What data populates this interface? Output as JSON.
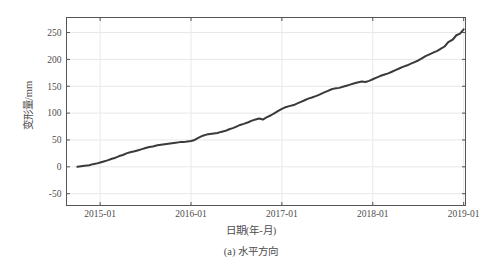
{
  "figure": {
    "caption": "(a) 水平方向"
  },
  "chart_data": {
    "type": "line",
    "title": "",
    "subtitle": "",
    "xlabel": "日期(年-月)",
    "ylabel": "变形量/mm",
    "xtick_labels": [
      "2015-01",
      "2016-01",
      "2017-01",
      "2018-01",
      "2019-01"
    ],
    "xtick_values": [
      2015.0,
      2016.0,
      2017.0,
      2018.0,
      2019.0
    ],
    "ytick_labels": [
      "-50",
      "0",
      "50",
      "100",
      "150",
      "200",
      "250"
    ],
    "ytick_values": [
      -50,
      0,
      50,
      100,
      150,
      200,
      250
    ],
    "xlim": [
      2014.63,
      2019.02
    ],
    "ylim": [
      -72,
      278
    ],
    "grid": true,
    "legend": null,
    "line_color": "#3a3a3a",
    "line_width": 2.0,
    "grid_color": "#e8e8e8",
    "axis_color": "#555555",
    "series": [
      {
        "name": "水平方向变形量",
        "x": [
          2014.75,
          2014.79,
          2014.83,
          2014.88,
          2014.92,
          2014.96,
          2015.0,
          2015.04,
          2015.08,
          2015.13,
          2015.17,
          2015.21,
          2015.25,
          2015.29,
          2015.33,
          2015.38,
          2015.42,
          2015.46,
          2015.5,
          2015.54,
          2015.58,
          2015.63,
          2015.67,
          2015.71,
          2015.75,
          2015.79,
          2015.83,
          2015.88,
          2015.92,
          2015.96,
          2016.0,
          2016.04,
          2016.08,
          2016.13,
          2016.17,
          2016.21,
          2016.25,
          2016.29,
          2016.33,
          2016.38,
          2016.42,
          2016.46,
          2016.5,
          2016.54,
          2016.58,
          2016.63,
          2016.67,
          2016.71,
          2016.75,
          2016.79,
          2016.83,
          2016.88,
          2016.92,
          2016.96,
          2017.0,
          2017.04,
          2017.08,
          2017.13,
          2017.17,
          2017.21,
          2017.25,
          2017.29,
          2017.33,
          2017.38,
          2017.42,
          2017.46,
          2017.5,
          2017.54,
          2017.58,
          2017.63,
          2017.67,
          2017.71,
          2017.75,
          2017.79,
          2017.83,
          2017.88,
          2017.92,
          2017.96,
          2018.0,
          2018.04,
          2018.08,
          2018.13,
          2018.17,
          2018.21,
          2018.25,
          2018.29,
          2018.33,
          2018.38,
          2018.42,
          2018.46,
          2018.5,
          2018.54,
          2018.58,
          2018.63,
          2018.67,
          2018.71,
          2018.75,
          2018.79,
          2018.83,
          2018.88,
          2018.92,
          2018.96,
          2019.0
        ],
        "y": [
          0,
          1,
          2,
          3,
          5,
          6,
          8,
          10,
          12,
          15,
          17,
          20,
          22,
          25,
          27,
          29,
          31,
          33,
          35,
          37,
          38,
          40,
          41,
          42,
          43,
          44,
          45,
          46,
          46,
          47,
          48,
          50,
          54,
          58,
          60,
          61,
          62,
          63,
          65,
          67,
          70,
          72,
          75,
          78,
          80,
          83,
          86,
          88,
          90,
          88,
          92,
          96,
          100,
          104,
          108,
          111,
          113,
          115,
          118,
          121,
          124,
          127,
          129,
          132,
          135,
          138,
          141,
          144,
          146,
          147,
          149,
          151,
          153,
          155,
          157,
          159,
          158,
          160,
          163,
          166,
          169,
          172,
          174,
          177,
          180,
          183,
          186,
          189,
          192,
          195,
          198,
          202,
          206,
          210,
          213,
          216,
          220,
          224,
          232,
          237,
          245,
          248,
          256
        ]
      }
    ]
  }
}
